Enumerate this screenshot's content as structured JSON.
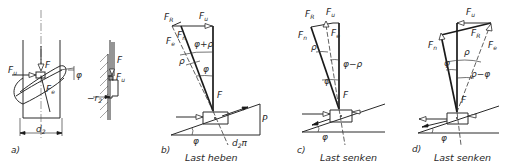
{
  "figure": {
    "panels": [
      {
        "id": "a",
        "label": "a)",
        "labels": {
          "Fu": "F",
          "Fu_sub": "u",
          "F": "F",
          "Fe": "F",
          "Fe_sub": "e",
          "phi": "φ",
          "d2": "d",
          "d2_sub": "2",
          "r2": "r",
          "r2_sub": "2",
          "F_side": "F",
          "Fu_side": "F",
          "Fu_side_sub": "u"
        }
      },
      {
        "id": "b",
        "label": "b)",
        "caption": "Last heben",
        "labels": {
          "FR": "F",
          "FR_sub": "R",
          "Fu": "F",
          "Fu_sub": "u",
          "Fn": "F",
          "Fn_sub": "n",
          "Fe": "F",
          "Fe_sub": "e",
          "angle_sum": "φ+ρ",
          "rho": "ρ",
          "phi": "φ",
          "F": "F",
          "phi_base": "φ",
          "d2pi": "d",
          "d2pi_sub": "2",
          "d2pi_tail": "π",
          "P": "P"
        }
      },
      {
        "id": "c",
        "label": "c)",
        "caption": "Last senken",
        "labels": {
          "FR": "F",
          "FR_sub": "R",
          "Fu": "F",
          "Fu_sub": "u",
          "Fn": "F",
          "Fn_sub": "n",
          "Fe": "F",
          "Fe_sub": "e",
          "rho": "ρ",
          "angle_diff": "φ−ρ",
          "phi": "φ",
          "F": "F",
          "phi_base": "φ"
        }
      },
      {
        "id": "d",
        "label": "d)",
        "caption": "Last senken",
        "labels": {
          "Fu": "F",
          "Fu_sub": "u",
          "FR": "F",
          "FR_sub": "R",
          "Fn": "F",
          "Fn_sub": "n",
          "Fe": "F",
          "Fe_sub": "e",
          "rho": "ρ",
          "phi": "φ",
          "angle_diff": "ρ−φ",
          "F": "F",
          "phi_base": "φ"
        }
      }
    ]
  }
}
